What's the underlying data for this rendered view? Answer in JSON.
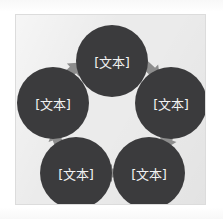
{
  "diagram": {
    "type": "cycle",
    "title": "",
    "direction": "counter-clockwise",
    "node_count": 5,
    "arrow_count": 5,
    "colors": {
      "panel_background": "#ebebeb",
      "panel_border": "#dcdcdc",
      "node_fill": "#3b3b3d",
      "node_text": "#f2f2f2",
      "arrow_fill": "#8d8d8d",
      "page_background": "#ffffff"
    },
    "nodes": [
      {
        "id": "node-top",
        "label": "[文本]",
        "position": "top",
        "cx": 96,
        "cy": 46,
        "r": 36
      },
      {
        "id": "node-right",
        "label": "[文本]",
        "position": "right",
        "cx": 155,
        "cy": 88,
        "r": 36
      },
      {
        "id": "node-bottom-right",
        "label": "[文本]",
        "position": "bottom-right",
        "cx": 133,
        "cy": 158,
        "r": 36
      },
      {
        "id": "node-bottom-left",
        "label": "[文本]",
        "position": "bottom-left",
        "cx": 60,
        "cy": 158,
        "r": 36
      },
      {
        "id": "node-left",
        "label": "[文本]",
        "position": "left",
        "cx": 37,
        "cy": 88,
        "r": 36
      }
    ],
    "arrows": [
      {
        "id": "arrow-left-to-top",
        "from": "node-left",
        "to": "node-top",
        "x": 57,
        "y": 55,
        "rotation": 47,
        "description": "points up-right"
      },
      {
        "id": "arrow-top-to-right",
        "from": "node-top",
        "to": "node-right",
        "x": 135,
        "y": 55,
        "rotation": 133,
        "description": "points down-right"
      },
      {
        "id": "arrow-right-to-bottomright",
        "from": "node-right",
        "to": "node-bottom-right",
        "x": 151,
        "y": 124,
        "rotation": 200,
        "description": "points down-left"
      },
      {
        "id": "arrow-bottomright-to-bottomleft",
        "from": "node-bottom-right",
        "to": "node-bottom-left",
        "x": 96,
        "y": 158,
        "rotation": 270,
        "description": "points left"
      },
      {
        "id": "arrow-bottomleft-to-left",
        "from": "node-bottom-left",
        "to": "node-left",
        "x": 41,
        "y": 124,
        "rotation": 340,
        "description": "points up"
      }
    ]
  }
}
